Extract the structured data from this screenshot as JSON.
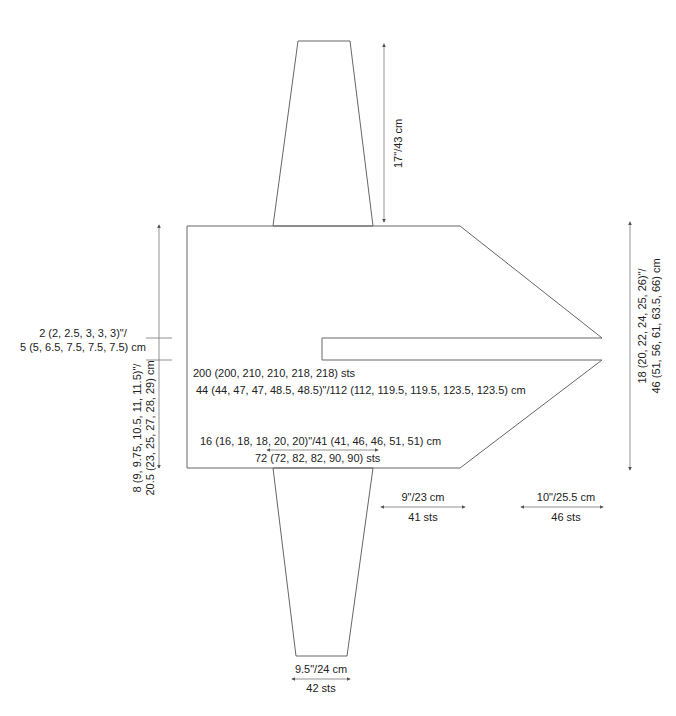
{
  "colors": {
    "outline": "#555555",
    "dimension": "#777777",
    "text": "#222222",
    "background": "#ffffff"
  },
  "schematic": {
    "sleeve_length": "17\"/43 cm",
    "neck_depth_line1": "2 (2, 2.5, 3, 3, 3)\"/",
    "neck_depth_line2": "5 (5, 6.5, 7.5, 7.5, 7.5) cm",
    "body_height_line1": "8 (9, 9.75, 10.5, 11, 11.5)\"/",
    "body_height_line2": "20.5 (23, 25, 27, 28, 29) cm",
    "body_sts": "200 (200, 210, 210, 218, 218) sts",
    "body_width": "44 (44, 47, 47, 48.5, 48.5)\"/112 (112, 119.5, 119.5, 123.5, 123.5) cm",
    "upper_arm_width": "16 (16, 18, 18, 20, 20)\"/41 (41, 46, 46, 51, 51) cm",
    "upper_arm_sts": "72 (72, 82, 82, 90, 90) sts",
    "front_section_width": "9\"/23 cm",
    "front_section_sts": "41 sts",
    "point_section_width": "10\"/25.5 cm",
    "point_section_sts": "46 sts",
    "total_height_line1": "18 (20, 22, 24, 25, 26)\"/",
    "total_height_line2": "46 (51, 56, 61, 63.5, 66) cm",
    "cuff_width": "9.5\"/24 cm",
    "cuff_sts": "42 sts"
  }
}
